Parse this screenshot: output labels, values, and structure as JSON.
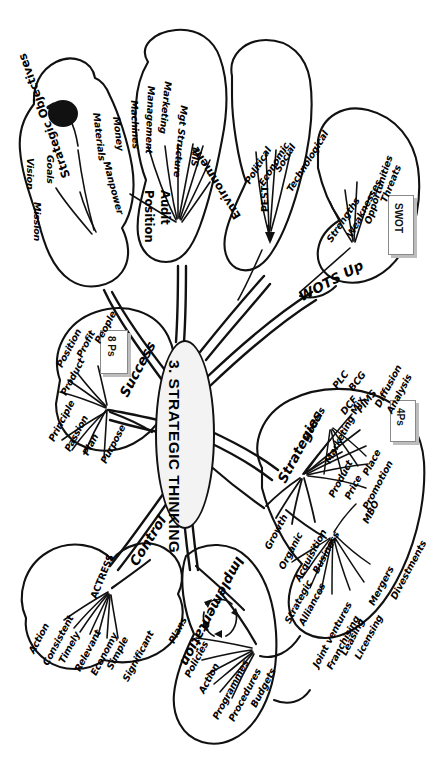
{
  "center": {
    "label": "3. STRATEGIC THINKING"
  },
  "branches": [
    {
      "id": "strategic-objectives",
      "label": "Strategic Objectives",
      "children": [
        "Mission",
        "Vision",
        "Goals"
      ],
      "icon": "apple-icon"
    },
    {
      "id": "position-audit",
      "label": "Position Audit",
      "children": [
        "Manpower",
        "Materials",
        "Money",
        "Machines",
        "Management",
        "Marketing",
        "Mgt Structure",
        "MIS"
      ]
    },
    {
      "id": "environment",
      "label": "Environment",
      "node": "PEST",
      "children": [
        "Political",
        "Economic",
        "Social",
        "Technological"
      ]
    },
    {
      "id": "wots-up",
      "label": "WOTS Up",
      "children": [
        "Strengths",
        "Weaknesses",
        "Opportunities",
        "Threats"
      ],
      "box": "SWOT"
    },
    {
      "id": "success",
      "label": "Success",
      "children": [
        "Principle",
        "Passion",
        "Plan",
        "Purpose",
        "Product",
        "Position",
        "Profit",
        "People"
      ],
      "box": "8 Ps"
    },
    {
      "id": "control",
      "label": "Control",
      "node": "ACTRESS",
      "children": [
        "Action",
        "Consistent",
        "Timely",
        "Relevant",
        "Economy",
        "Simple",
        "Significant"
      ]
    },
    {
      "id": "implementation",
      "label": "Implementation",
      "children": [
        "Plans",
        "Policies",
        "Action",
        "Programmes",
        "Procedures",
        "Budgets"
      ],
      "icon": "cycle-arrows-icon"
    },
    {
      "id": "strategies",
      "label": "Strategies",
      "children": [
        "Growth",
        "Organic",
        "Acquisition",
        "Business",
        "Models",
        "Marketing Mix"
      ],
      "sub": {
        "models": [
          "PLC",
          "BCG",
          "DCF",
          "PIMS",
          "Diffusion Analysis"
        ],
        "marketing_mix": [
          "Product",
          "Price",
          "Place",
          "Promotion"
        ],
        "marketing_mix_box": "4Ps",
        "acquisition": [
          "Strategic Alliances",
          "Joint ventures",
          "Franchising",
          "Leasing",
          "Licensing",
          "Mergers",
          "Divestments",
          "MBO"
        ]
      }
    }
  ],
  "labels": {
    "strategic_objectives": "Strategic Objectives",
    "so_1": "Mission",
    "so_2": "Vision",
    "so_3": "Goals",
    "position_audit_1": "Position",
    "position_audit_2": "Audit",
    "pa_1": "Manpower",
    "pa_2": "Materials",
    "pa_3": "Money",
    "pa_4": "Machines",
    "pa_5": "Management",
    "pa_6": "Marketing",
    "pa_7": "Mgt Structure",
    "pa_8": "MIS",
    "environment": "Environment",
    "pest": "PEST",
    "pest_1": "Political",
    "pest_2": "Economic",
    "pest_3": "Social",
    "pest_4": "Technological",
    "wots_up": "WOTS Up",
    "w_1": "Strengths",
    "w_2": "Weaknesses",
    "w_3": "Opportunities",
    "w_4": "Threats",
    "swot_box": "SWOT",
    "success": "Success",
    "s_1": "Principle",
    "s_2": "Passion",
    "s_3": "Plan",
    "s_4": "Purpose",
    "s_5": "Product",
    "s_6": "Position",
    "s_7": "Profit",
    "s_8": "People",
    "eightps_box": "8 Ps",
    "control": "Control",
    "actress": "ACTRESS",
    "a_1": "Action",
    "a_2": "Consistent",
    "a_3": "Timely",
    "a_4": "Relevant",
    "a_5": "Economy",
    "a_6": "Simple",
    "a_7": "Significant",
    "implementation": "Implementation",
    "i_1": "Plans",
    "i_2": "Policies",
    "i_3": "Action",
    "i_4": "Programmes",
    "i_5": "Procedures",
    "i_6": "Budgets",
    "strategies": "Strategies",
    "st_growth": "Growth",
    "st_organic": "Organic",
    "st_acq": "Acquisition",
    "st_business": "Business",
    "st_models": "Models",
    "st_mm": "Marketing Mix",
    "m_1": "PLC",
    "m_2": "BCG",
    "m_3": "DCF",
    "m_4": "PIMS",
    "m_5a": "Diffusion",
    "m_5b": "Analysis",
    "mm_1": "Product",
    "mm_2": "Price",
    "mm_3": "Place",
    "mm_4": "Promotion",
    "fourps_box": "4Ps",
    "ac_1a": "Strategic",
    "ac_1b": "Alliances",
    "ac_2": "Joint ventures",
    "ac_3": "Franchising",
    "ac_4": "Leasing",
    "ac_5": "Licensing",
    "ac_6": "Mergers",
    "ac_7": "Divestments",
    "ac_8": "MBO"
  }
}
